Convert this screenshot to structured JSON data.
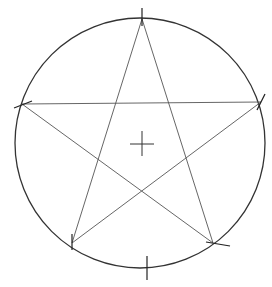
{
  "diagram": {
    "background": "#ffffff",
    "stroke_color": "#333333",
    "circle": {
      "cx": 140,
      "cy": 143,
      "r": 125
    },
    "center_mark": {
      "x": 142,
      "y": 144,
      "size": 12
    },
    "points": {
      "top": [
        142,
        19
      ],
      "left": [
        22,
        104
      ],
      "right": [
        261,
        102
      ],
      "bottom_left": [
        72,
        243
      ],
      "bottom_right": [
        213,
        243
      ]
    },
    "construction_marks": [
      {
        "name": "top-tick",
        "x1": 142,
        "y1": 8,
        "x2": 142,
        "y2": 26
      },
      {
        "name": "left-tick",
        "x1": 14,
        "y1": 108,
        "x2": 32,
        "y2": 101
      },
      {
        "name": "right-tick",
        "x1": 265,
        "y1": 94,
        "x2": 257,
        "y2": 110
      },
      {
        "name": "bottom-left-tick",
        "x1": 72,
        "y1": 234,
        "x2": 72,
        "y2": 250
      },
      {
        "name": "bottom-right-tick",
        "x1": 206,
        "y1": 242,
        "x2": 230,
        "y2": 246
      },
      {
        "name": "bottom-tick",
        "x1": 147,
        "y1": 256,
        "x2": 147,
        "y2": 280
      }
    ]
  }
}
